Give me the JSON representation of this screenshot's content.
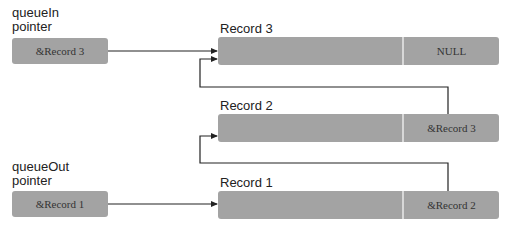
{
  "pointers": {
    "queue_in": {
      "label_line1": "queueIn",
      "label_line2": "pointer",
      "value": "&Record 3"
    },
    "queue_out": {
      "label_line1": "queueOut",
      "label_line2": "pointer",
      "value": "&Record 1"
    }
  },
  "records": [
    {
      "title": "Record 3",
      "data": "",
      "next": "NULL"
    },
    {
      "title": "Record 2",
      "data": "",
      "next": "&Record 3"
    },
    {
      "title": "Record 1",
      "data": "",
      "next": "&Record 2"
    }
  ],
  "colors": {
    "box_fill": "#a3a3a3",
    "line": "#222222",
    "background": "#ffffff"
  }
}
